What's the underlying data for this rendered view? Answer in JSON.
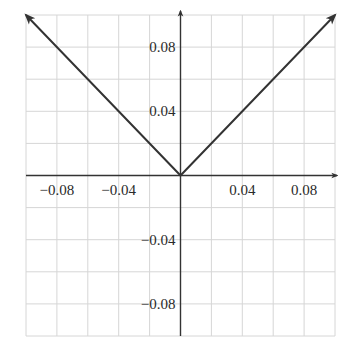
{
  "chart_data": {
    "type": "line",
    "title": "",
    "xlabel": "",
    "ylabel": "",
    "xlim": [
      -0.1,
      0.1
    ],
    "ylim": [
      -0.1,
      0.1
    ],
    "grid": true,
    "grid_step": 0.02,
    "function": "y = |x|",
    "series": [
      {
        "name": "y = |x|",
        "x": [
          -0.1,
          0,
          0.1
        ],
        "y": [
          0.1,
          0,
          0.1
        ],
        "arrows_at_ends": true,
        "color": "#333333"
      }
    ],
    "x_ticks": [
      {
        "value": -0.08,
        "label": "−0.08"
      },
      {
        "value": -0.04,
        "label": "−0.04"
      },
      {
        "value": 0.04,
        "label": "0.04"
      },
      {
        "value": 0.08,
        "label": "0.08"
      }
    ],
    "y_ticks": [
      {
        "value": 0.08,
        "label": "0.08"
      },
      {
        "value": 0.04,
        "label": "0.04"
      },
      {
        "value": -0.04,
        "label": "−0.04"
      },
      {
        "value": -0.08,
        "label": "−0.08"
      }
    ],
    "legend": null
  },
  "colors": {
    "grid": "#d6d6d6",
    "axis": "#333333",
    "line": "#333333",
    "background": "#ffffff"
  }
}
